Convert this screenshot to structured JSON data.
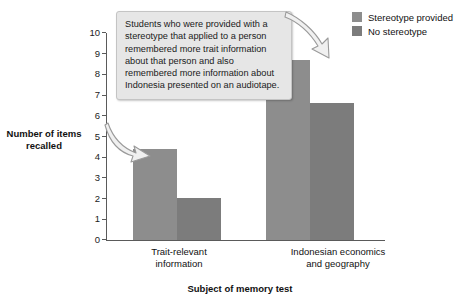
{
  "chart_data": {
    "type": "bar",
    "title": "",
    "xlabel": "Subject of memory test",
    "ylabel": "Number of items recalled",
    "ylim": [
      0,
      10
    ],
    "yticks": [
      "10",
      "9",
      "8",
      "7",
      "6",
      "5",
      "4",
      "3",
      "2",
      "1",
      "0"
    ],
    "grid": false,
    "legend_position": "top-right",
    "categories": [
      "Trait-relevant information",
      "Indonesian economics and geography"
    ],
    "category_lines": [
      [
        "Trait-relevant",
        "information"
      ],
      [
        "Indonesian economics",
        "and geography"
      ]
    ],
    "series": [
      {
        "name": "Stereotype provided",
        "color": "#8d8d8d",
        "values": [
          4.4,
          8.7
        ]
      },
      {
        "name": "No stereotype",
        "color": "#7c7c7c",
        "values": [
          2.05,
          6.6
        ]
      }
    ],
    "annotations": [
      {
        "text": "Students who were provided with a stereotype that applied to a person remembered more trait information about that person and also remembered more information about Indonesia presented on an audiotape.",
        "points_to": [
          "Trait-relevant information / Stereotype provided bar",
          "Indonesian economics and geography / Stereotype provided bar"
        ]
      }
    ]
  },
  "legend": {
    "items": [
      {
        "label": "Stereotype provided"
      },
      {
        "label": "No stereotype"
      }
    ]
  },
  "callout": {
    "text": "Students who were provided with a stereotype that applied to a person remembered more trait information about that person and also remembered more information about Indonesia presented on an audiotape."
  }
}
